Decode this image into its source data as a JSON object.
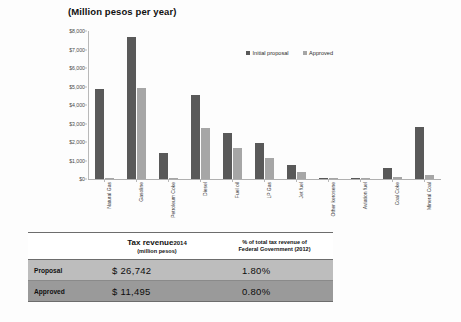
{
  "chart_data": {
    "type": "bar",
    "title": "(Million pesos per year)",
    "xlabel": "",
    "ylabel": "",
    "ylim": [
      0,
      8000
    ],
    "ytick_labels": [
      "$8,000",
      "$7,000",
      "$6,000",
      "$5,000",
      "$4,000",
      "$3,000",
      "$2,000",
      "$1,000",
      "$0"
    ],
    "ytick_values": [
      8000,
      7000,
      6000,
      5000,
      4000,
      3000,
      2000,
      1000,
      0
    ],
    "grid": false,
    "legend_position": "top-right",
    "categories": [
      "Natural Gas",
      "Gasoline",
      "Petroleum Coke",
      "Diesel",
      "Fuel oil",
      "LP Gas",
      "Jet fuel",
      "Other kerosene",
      "Aviation fuel",
      "Coal Coke",
      "Mineral Coal"
    ],
    "series": [
      {
        "name": "Initial proposal",
        "color": "#595959",
        "values": [
          4850,
          7700,
          1400,
          4550,
          2500,
          1950,
          750,
          20,
          15,
          600,
          2800
        ]
      },
      {
        "name": "Approved",
        "color": "#a6a6a6",
        "values": [
          0,
          4900,
          60,
          2750,
          1650,
          1150,
          400,
          10,
          8,
          120,
          230
        ]
      }
    ]
  },
  "table": {
    "headers": {
      "label": "",
      "revenue_main": "Tax revenue",
      "revenue_year": "2014",
      "revenue_sub": "(million pesos)",
      "pct_line1": "% of total tax revenue of",
      "pct_line2": "Federal Government (2012)"
    },
    "rows": [
      {
        "label": "Proposal",
        "revenue": "$ 26,742",
        "pct": "1.80%"
      },
      {
        "label": "Approved",
        "revenue": "$ 11,495",
        "pct": "0.80%"
      }
    ]
  }
}
